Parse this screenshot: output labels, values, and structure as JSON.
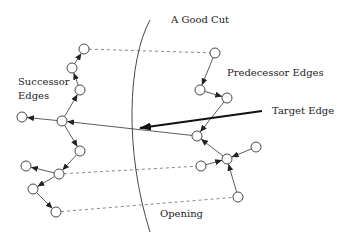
{
  "labels": {
    "cut": "A Good Cut",
    "successor_line1": "Successor",
    "successor_line2": "Edges",
    "predecessor": "Predecessor Edges",
    "target": "Target Edge",
    "opening": "Opening"
  },
  "colors": {
    "stroke": "#333333",
    "background": "#ffffff"
  },
  "nodes": {
    "left": [
      {
        "id": "L1",
        "x": 84,
        "y": 49
      },
      {
        "id": "L2",
        "x": 72,
        "y": 68
      },
      {
        "id": "L3",
        "x": 80,
        "y": 90
      },
      {
        "id": "L4",
        "x": 22,
        "y": 117
      },
      {
        "id": "L5",
        "x": 62,
        "y": 121
      },
      {
        "id": "L6",
        "x": 80,
        "y": 151
      },
      {
        "id": "L7",
        "x": 26,
        "y": 166
      },
      {
        "id": "L8",
        "x": 59,
        "y": 174
      },
      {
        "id": "L9",
        "x": 33,
        "y": 189
      },
      {
        "id": "L10",
        "x": 56,
        "y": 212
      }
    ],
    "right": [
      {
        "id": "R1",
        "x": 215,
        "y": 53
      },
      {
        "id": "R2",
        "x": 200,
        "y": 90
      },
      {
        "id": "R3",
        "x": 227,
        "y": 98
      },
      {
        "id": "R4",
        "x": 197,
        "y": 136
      },
      {
        "id": "R5",
        "x": 227,
        "y": 159
      },
      {
        "id": "R6",
        "x": 256,
        "y": 147
      },
      {
        "id": "R7",
        "x": 201,
        "y": 166
      },
      {
        "id": "R8",
        "x": 238,
        "y": 197
      }
    ]
  },
  "edges": [
    {
      "from": "L5",
      "to": "L3"
    },
    {
      "from": "L3",
      "to": "L2"
    },
    {
      "from": "L2",
      "to": "L1"
    },
    {
      "from": "L5",
      "to": "L4"
    },
    {
      "from": "L5",
      "to": "L6"
    },
    {
      "from": "L6",
      "to": "L8"
    },
    {
      "from": "L8",
      "to": "L7"
    },
    {
      "from": "L8",
      "to": "L9"
    },
    {
      "from": "L9",
      "to": "L10"
    },
    {
      "from": "R1",
      "to": "R2"
    },
    {
      "from": "R2",
      "to": "R3"
    },
    {
      "from": "R3",
      "to": "R4"
    },
    {
      "from": "R5",
      "to": "R4"
    },
    {
      "from": "R6",
      "to": "R5"
    },
    {
      "from": "R7",
      "to": "R5"
    },
    {
      "from": "R8",
      "to": "R5"
    },
    {
      "from": "R4",
      "to": "L5"
    }
  ],
  "dashed_links": [
    {
      "from": "L1",
      "to": "R1"
    },
    {
      "from": "L8",
      "to": "R7"
    },
    {
      "from": "L10",
      "to": "R8"
    }
  ],
  "target_arrow": {
    "x1": 262,
    "y1": 111,
    "x2": 140,
    "y2": 128
  }
}
